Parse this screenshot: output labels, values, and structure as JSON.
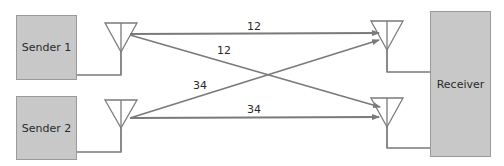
{
  "diagram": {
    "type": "mimo-antenna-diagram",
    "senders": [
      {
        "label": "Sender 1"
      },
      {
        "label": "Sender 2"
      }
    ],
    "receiver": {
      "label": "Receiver"
    },
    "links": [
      {
        "from": "Sender 1",
        "to": "Receiver antenna 1",
        "label": "12"
      },
      {
        "from": "Sender 1",
        "to": "Receiver antenna 2",
        "label": "12"
      },
      {
        "from": "Sender 2",
        "to": "Receiver antenna 1",
        "label": "34"
      },
      {
        "from": "Sender 2",
        "to": "Receiver antenna 2",
        "label": "34"
      }
    ],
    "colors": {
      "box_fill": "#c8c8c8",
      "line": "#7a7a7a",
      "text": "#2a2a2a"
    }
  }
}
